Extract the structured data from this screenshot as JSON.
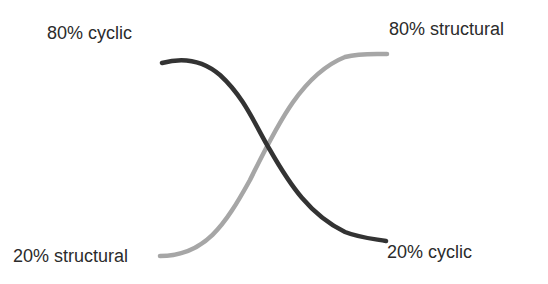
{
  "labels": {
    "top_left": "80% cyclic",
    "top_right": "80% structural",
    "bottom_left": "20% structural",
    "bottom_right": "20% cyclic"
  },
  "curves": {
    "cyclic": {
      "color": "#333333",
      "from": "80% cyclic",
      "to": "20% cyclic"
    },
    "structural": {
      "color": "#a6a6a6",
      "from": "20% structural",
      "to": "80% structural"
    }
  }
}
